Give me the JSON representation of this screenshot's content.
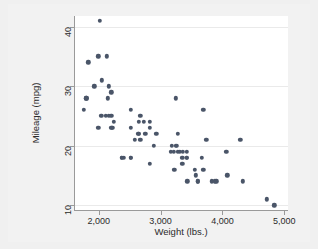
{
  "figure": {
    "background_color": "#f2f2f2",
    "plot_background_color": "#ffffff",
    "marker_color": "#4a5568",
    "gridline_color": "#eaeaea",
    "axis_color": "#9a9a9a"
  },
  "chart_data": {
    "type": "scatter",
    "title": "",
    "xlabel": "Weight (lbs.)",
    "ylabel": "Mileage (mpg)",
    "xlim": [
      1600,
      5060
    ],
    "ylim": [
      9.2,
      41.8
    ],
    "xticks": [
      2000,
      3000,
      4000,
      5000
    ],
    "xtick_labels": [
      "2,000",
      "3,000",
      "4,000",
      "5,000"
    ],
    "yticks": [
      10,
      20,
      30,
      40
    ],
    "ytick_labels": [
      "10",
      "20",
      "30",
      "40"
    ],
    "grid": "horizontal",
    "legend": "none",
    "n_points": 74,
    "series": [
      {
        "name": "Mileage vs Weight",
        "marker": "circle",
        "color": "#4a5568",
        "points": [
          [
            2930,
            22
          ],
          [
            3350,
            17
          ],
          [
            2640,
            22
          ],
          [
            3250,
            20
          ],
          [
            4080,
            15
          ],
          [
            3670,
            18
          ],
          [
            3690,
            26
          ],
          [
            3180,
            20
          ],
          [
            3220,
            16
          ],
          [
            4060,
            19
          ],
          [
            3600,
            14
          ],
          [
            3600,
            14
          ],
          [
            3740,
            21
          ],
          [
            4840,
            10
          ],
          [
            4720,
            11
          ],
          [
            3830,
            14
          ],
          [
            2580,
            21
          ],
          [
            3350,
            18
          ],
          [
            2200,
            29
          ],
          [
            2520,
            23
          ],
          [
            2130,
            35
          ],
          [
            2650,
            24
          ],
          [
            1800,
            28
          ],
          [
            4330,
            14
          ],
          [
            3900,
            14
          ],
          [
            4290,
            21
          ],
          [
            2110,
            25
          ],
          [
            2200,
            25
          ],
          [
            2150,
            28
          ],
          [
            3250,
            28
          ],
          [
            2670,
            21
          ],
          [
            2370,
            18
          ],
          [
            2890,
            20
          ],
          [
            2050,
            31
          ],
          [
            1990,
            35
          ],
          [
            2240,
            24
          ],
          [
            2520,
            26
          ],
          [
            2410,
            18
          ],
          [
            2370,
            18
          ],
          [
            2730,
            24
          ],
          [
            2830,
            17
          ],
          [
            3210,
            19
          ],
          [
            2020,
            41
          ],
          [
            2160,
            25
          ],
          [
            2040,
            25
          ],
          [
            1930,
            30
          ],
          [
            1990,
            23
          ],
          [
            3420,
            19
          ],
          [
            2520,
            18
          ],
          [
            3170,
            19
          ],
          [
            3260,
            20
          ],
          [
            3280,
            19
          ],
          [
            3880,
            14
          ],
          [
            2220,
            23
          ],
          [
            2520,
            18
          ],
          [
            2830,
            23
          ],
          [
            3310,
            19
          ],
          [
            3420,
            18
          ],
          [
            2830,
            24
          ],
          [
            3420,
            18
          ],
          [
            3690,
            16
          ],
          [
            3360,
            19
          ],
          [
            2200,
            23
          ],
          [
            1830,
            34
          ],
          [
            1760,
            26
          ],
          [
            2650,
            22
          ],
          [
            1800,
            28
          ],
          [
            3280,
            22
          ],
          [
            2750,
            22
          ],
          [
            2160,
            30
          ],
          [
            2670,
            25
          ],
          [
            3430,
            14
          ],
          [
            3550,
            16
          ],
          [
            3570,
            15
          ]
        ]
      }
    ]
  }
}
